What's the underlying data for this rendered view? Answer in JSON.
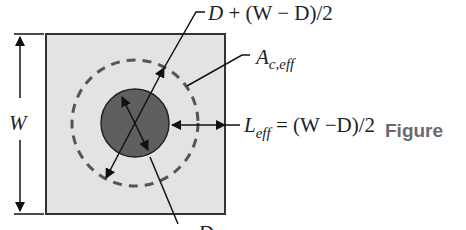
{
  "diagram": {
    "labels": {
      "width_label": "W",
      "top_label_var": "D",
      "top_label_expr": " + (W − D)/2",
      "area_label_main": "A",
      "area_label_sub": "c,eff",
      "length_label_main": "L",
      "length_label_sub": "eff",
      "length_label_expr": " = (W −D)/2",
      "bottom_label": "D"
    },
    "caption": "Figure",
    "colors": {
      "square_fill": "#e3e3e3",
      "square_stroke": "#333333",
      "inner_circle_fill": "#5f5f5f",
      "dashed_circle_stroke": "#555555",
      "line": "#111111",
      "caption": "#6b6b6b"
    }
  }
}
